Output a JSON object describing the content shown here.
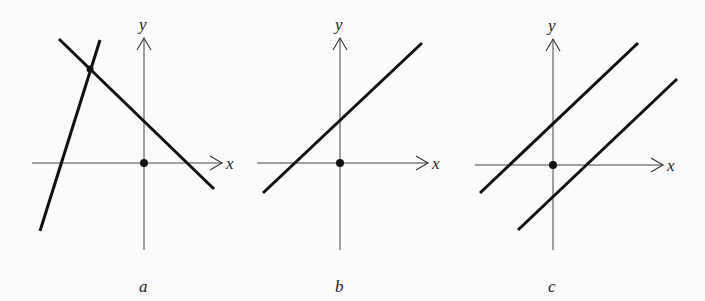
{
  "figure": {
    "colors": {
      "background": "#fbfbfb",
      "line": "#111111",
      "axis": "#444444"
    },
    "panels": [
      {
        "id": "a",
        "label": "a",
        "x_axis_label": "x",
        "y_axis_label": "y",
        "meaning": "two intersecting lines (one solution)"
      },
      {
        "id": "b",
        "label": "b",
        "x_axis_label": "x",
        "y_axis_label": "y",
        "meaning": "single line (coincident lines, infinitely many solutions)"
      },
      {
        "id": "c",
        "label": "c",
        "x_axis_label": "x",
        "y_axis_label": "y",
        "meaning": "two parallel lines (no solution)"
      }
    ]
  }
}
